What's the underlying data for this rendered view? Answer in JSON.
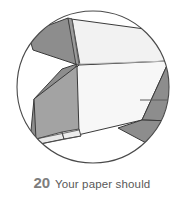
{
  "figure": {
    "kind": "origami-step-diagram",
    "shape": "circle",
    "background_color": "#ffffff"
  },
  "caption": {
    "step_number": "20",
    "text": "Your paper should",
    "number_color": "#7d7d7d",
    "text_color": "#585858"
  },
  "diagram": {
    "circle": {
      "cx": 93,
      "cy": 87,
      "r": 76,
      "stroke_color": "#4a4a4a",
      "stroke_width": 1,
      "fill": "#ffffff"
    },
    "palette": {
      "paper_light": "#f2f2f2",
      "paper_lighter": "#f7f7f7",
      "paper_white": "#ffffff",
      "shade_mid": "#d4d4d4",
      "shade_dark": "#8f8f8f",
      "shade_darker": "#7f7f7f",
      "outline": "#3a3a3a",
      "crease": "#b4b4b4"
    },
    "facets": [
      {
        "name": "top-right-large-panel",
        "fill": "#f2f2f2",
        "stroke": "#3a3a3a",
        "points": "71,20 168,62 78,66 70,24"
      },
      {
        "name": "top-left-dark-wedge",
        "fill": "#8f8f8f",
        "stroke": "#3a3a3a",
        "points": "69,20 78,66 33,49 30,36"
      },
      {
        "name": "top-narrow-sliver",
        "fill": "#9a9a9a",
        "stroke": "#3a3a3a",
        "points": "69,20 72,20 80,66 76,66"
      },
      {
        "name": "center-white-panel",
        "fill": "#f7f7f7",
        "stroke": "#3a3a3a",
        "points": "78,66 168,62 141,120 35,145 76,68"
      },
      {
        "name": "mid-left-shaded-flap",
        "fill": "#8f8f8f",
        "stroke": "#3a3a3a",
        "points": "76,66 35,145 30,140 36,100 62,70"
      },
      {
        "name": "lower-left-inner-wall",
        "fill": "#a2a2a2",
        "stroke": "#3a3a3a",
        "points": "36,100 76,68 78,137 36,139"
      },
      {
        "name": "lower-left-small-tab",
        "fill": "#e6e6e6",
        "stroke": "#3a3a3a",
        "points": "35,145 36,139 62,133 63,139"
      },
      {
        "name": "lower-left-second-tab",
        "fill": "#eaeaea",
        "stroke": "#3a3a3a",
        "points": "63,139 62,133 78,130 80,136"
      },
      {
        "name": "right-dark-triangle",
        "fill": "#8f8f8f",
        "stroke": "#3a3a3a",
        "points": "168,62 166,120 141,120"
      },
      {
        "name": "right-lower-dark-wedge",
        "fill": "#8f8f8f",
        "stroke": "#3a3a3a",
        "points": "141,120 166,120 160,146 120,128"
      }
    ],
    "creases": [
      {
        "name": "horizontal-crease-center",
        "x1": 78,
        "y1": 64,
        "x2": 168,
        "y2": 62,
        "color": "#b4b4b4"
      },
      {
        "name": "horizontal-crease-right",
        "x1": 141,
        "y1": 100,
        "x2": 170,
        "y2": 100,
        "color": "#6a6a6a"
      },
      {
        "name": "vertical-crease-top",
        "x1": 71,
        "y1": 20,
        "x2": 78,
        "y2": 66,
        "color": "#6a6a6a"
      }
    ]
  }
}
